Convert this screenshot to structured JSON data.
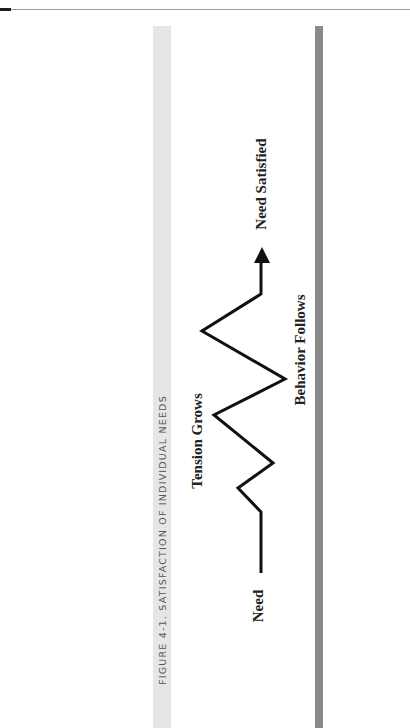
{
  "page": {
    "caption": "FIGURE 4-1. SATISFACTION OF INDIVIDUAL NEEDS"
  },
  "diagram": {
    "labels": {
      "need": "Need",
      "tension": "Tension Grows",
      "behavior": "Behavior Follows",
      "satisfied": "Need Satisfied"
    },
    "path_points": [
      [
        261,
        573
      ],
      [
        261,
        512
      ],
      [
        238,
        488
      ],
      [
        273,
        463
      ],
      [
        214,
        415
      ],
      [
        285,
        379
      ],
      [
        202,
        331
      ],
      [
        261,
        294
      ],
      [
        261,
        262
      ]
    ],
    "arrow": {
      "tip": [
        262,
        247
      ],
      "base_y": 263,
      "half_width": 8
    },
    "colors": {
      "line": "#111111",
      "caption_bar": "#e6e6e6",
      "rule_bar": "#8a8a8a",
      "caption_text": "#555555"
    }
  }
}
